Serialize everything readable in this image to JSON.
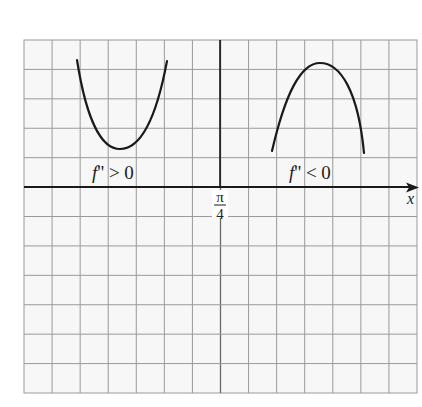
{
  "figure": {
    "caption_partial": "",
    "grid": {
      "left": 24,
      "top": 40,
      "right": 417,
      "bottom": 393,
      "columns": 14,
      "rows": 12,
      "line_color": "#9a9a9a",
      "background": "#f7f7f7"
    },
    "axis": {
      "x_label": "x",
      "x_axis_y": 187,
      "tick_label_numerator": "π",
      "tick_label_denominator": "4",
      "tick_x": 220,
      "color": "#1a1a1a"
    },
    "curves": [
      {
        "name": "concave-up-parabola",
        "description": "U-shaped curve, second derivative positive",
        "label": "f'' > 0",
        "label_f": "f",
        "label_rest": "'' > 0",
        "path": "M77,60 C88,130 105,149 120,149 C138,149 155,125 167,61",
        "label_x": 92,
        "label_y": 179
      },
      {
        "name": "concave-down-parabola",
        "description": "Inverted U-shaped curve, second derivative negative",
        "label": "f'' < 0",
        "label_f": "f",
        "label_rest": "'' < 0",
        "path": "M272,151 C285,95 300,63 320,63 C340,63 358,90 364,153",
        "label_x": 289,
        "label_y": 179
      }
    ]
  }
}
